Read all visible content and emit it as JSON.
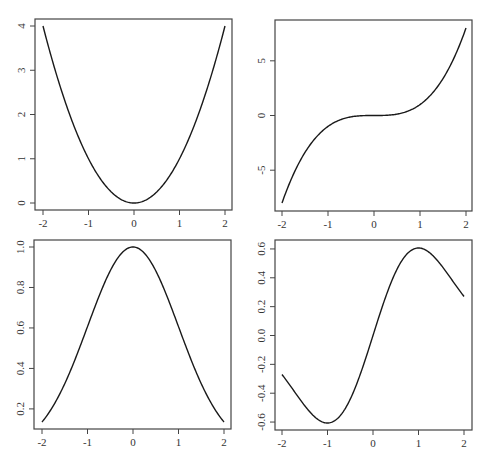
{
  "chart_data": [
    {
      "type": "line",
      "title": "",
      "xlabel": "",
      "ylabel": "",
      "function": "x^2",
      "xlim": [
        -2,
        2
      ],
      "ylim": [
        0,
        4
      ],
      "x_ticks": [
        "-2",
        "-1",
        "0",
        "1",
        "2"
      ],
      "y_ticks": [
        "0",
        "1",
        "2",
        "3",
        "4"
      ],
      "x": [
        -2,
        -1.5,
        -1,
        -0.5,
        0,
        0.5,
        1,
        1.5,
        2
      ],
      "values": [
        4,
        2.25,
        1,
        0.25,
        0,
        0.25,
        1,
        2.25,
        4
      ],
      "grid": false
    },
    {
      "type": "line",
      "title": "",
      "xlabel": "",
      "ylabel": "",
      "function": "x^3",
      "xlim": [
        -2,
        2
      ],
      "ylim": [
        -8,
        8
      ],
      "x_ticks": [
        "-2",
        "-1",
        "0",
        "1",
        "2"
      ],
      "y_ticks": [
        "-5",
        "0",
        "5"
      ],
      "x": [
        -2,
        -1.5,
        -1,
        -0.5,
        0,
        0.5,
        1,
        1.5,
        2
      ],
      "values": [
        -8,
        -3.375,
        -1,
        -0.125,
        0,
        0.125,
        1,
        3.375,
        8
      ],
      "grid": false
    },
    {
      "type": "line",
      "title": "",
      "xlabel": "",
      "ylabel": "",
      "function": "exp(-x^2/2)",
      "xlim": [
        -2,
        2
      ],
      "ylim": [
        0.135,
        1.0
      ],
      "x_ticks": [
        "-2",
        "-1",
        "0",
        "1",
        "2"
      ],
      "y_ticks": [
        "0.2",
        "0.4",
        "0.6",
        "0.8",
        "1.0"
      ],
      "x": [
        -2,
        -1.5,
        -1,
        -0.5,
        0,
        0.5,
        1,
        1.5,
        2
      ],
      "values": [
        0.135,
        0.325,
        0.607,
        0.882,
        1.0,
        0.882,
        0.607,
        0.325,
        0.135
      ],
      "grid": false
    },
    {
      "type": "line",
      "title": "",
      "xlabel": "",
      "ylabel": "",
      "function": "x*exp(-x^2/2)",
      "xlim": [
        -2,
        2
      ],
      "ylim": [
        -0.607,
        0.607
      ],
      "x_ticks": [
        "-2",
        "-1",
        "0",
        "1",
        "2"
      ],
      "y_ticks": [
        "-0.6",
        "-0.4",
        "-0.2",
        "0.0",
        "0.2",
        "0.4",
        "0.6"
      ],
      "x": [
        -2,
        -1.5,
        -1,
        -0.5,
        0,
        0.5,
        1,
        1.5,
        2
      ],
      "values": [
        -0.271,
        -0.487,
        -0.607,
        -0.441,
        0,
        0.441,
        0.607,
        0.487,
        0.271
      ],
      "grid": false
    }
  ],
  "panels": [
    {
      "name": "panel-x-squared",
      "box": {
        "left": 35,
        "top": 19,
        "right": 232,
        "bottom": 210
      },
      "xpix": [
        43,
        225
      ],
      "ypix": [
        203,
        26
      ],
      "fn": "sq",
      "ymin": 0,
      "ymax": 4,
      "yticks": [
        0,
        1,
        2,
        3,
        4
      ],
      "ytick_labels": [
        "0",
        "1",
        "2",
        "3",
        "4"
      ]
    },
    {
      "name": "panel-x-cubed",
      "box": {
        "left": 275,
        "top": 20,
        "right": 472,
        "bottom": 211
      },
      "xpix": [
        282,
        466
      ],
      "ypix": [
        203,
        28
      ],
      "fn": "cube",
      "ymin": -8,
      "ymax": 8,
      "yticks": [
        -5,
        0,
        5
      ],
      "ytick_labels": [
        "-5",
        "0",
        "5"
      ]
    },
    {
      "name": "panel-gaussian",
      "box": {
        "left": 34,
        "top": 240,
        "right": 231,
        "bottom": 429
      },
      "xpix": [
        42,
        224
      ],
      "ypix": [
        422,
        247
      ],
      "fn": "gauss",
      "ymin": 0.1353,
      "ymax": 1.0,
      "yticks": [
        0.2,
        0.4,
        0.6,
        0.8,
        1.0
      ],
      "ytick_labels": [
        "0.2",
        "0.4",
        "0.6",
        "0.8",
        "1.0"
      ]
    },
    {
      "name": "panel-gaussian-derivative",
      "box": {
        "left": 275,
        "top": 240,
        "right": 472,
        "bottom": 430
      },
      "xpix": [
        282,
        464
      ],
      "ypix": [
        423,
        248
      ],
      "fn": "xgauss",
      "ymin": -0.6065,
      "ymax": 0.6065,
      "yticks": [
        -0.6,
        -0.4,
        -0.2,
        0.0,
        0.2,
        0.4,
        0.6
      ],
      "ytick_labels": [
        "-0.6",
        "-0.4",
        "-0.2",
        "0.0",
        "0.2",
        "0.4",
        "0.6"
      ]
    }
  ],
  "x_tick_labels": [
    "-2",
    "-1",
    "0",
    "1",
    "2"
  ],
  "colors": {
    "curve": "#1a1a1a",
    "axis": "#444444",
    "background": "#ffffff"
  }
}
